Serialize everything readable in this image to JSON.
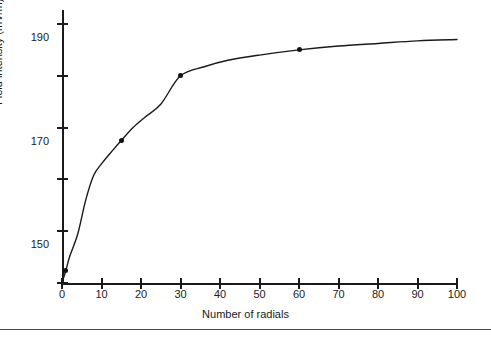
{
  "chart_data": {
    "type": "line",
    "title": "",
    "subtitle": "",
    "xlabel": "Number of radials",
    "ylabel": "Field intensity (mV/m)",
    "xlim": [
      0,
      100
    ],
    "ylim": [
      100,
      195
    ],
    "grid": false,
    "legend": "none",
    "x_ticks": [
      0,
      10,
      20,
      30,
      40,
      50,
      60,
      70,
      80,
      90,
      100
    ],
    "x_tick_labels": [
      "0",
      "10",
      "20",
      "30",
      "40",
      "50",
      "60",
      "70",
      "80",
      "90",
      "100"
    ],
    "y_ticks": [
      100,
      120,
      130,
      150,
      170,
      190
    ],
    "y_tick_labels": [
      "100",
      "120",
      "130",
      "150",
      "170",
      "190"
    ],
    "marker_color": "#111111",
    "line_color": "#1a1a1a",
    "axis_color": "#1a1a1a",
    "series": [
      {
        "name": "Field intensity",
        "marker": "dot",
        "x": [
          1,
          15,
          30,
          60
        ],
        "values": [
          105,
          145,
          170,
          180
        ]
      }
    ],
    "curve_points": {
      "x": [
        0,
        1,
        2,
        4,
        6,
        8,
        10,
        13,
        15,
        18,
        21,
        25,
        30,
        36,
        42,
        50,
        60,
        70,
        80,
        90,
        100
      ],
      "y": [
        100,
        105,
        110.5,
        119,
        126,
        131.5,
        136,
        141.5,
        145,
        150,
        154,
        159,
        170,
        173.5,
        176,
        178,
        180,
        181.5,
        182.5,
        183.5,
        184
      ]
    },
    "annotations": []
  },
  "figure": {
    "background_color": "#ffffff",
    "has_bottom_rule": true,
    "bottom_rule_color": "#4a4a4a"
  }
}
